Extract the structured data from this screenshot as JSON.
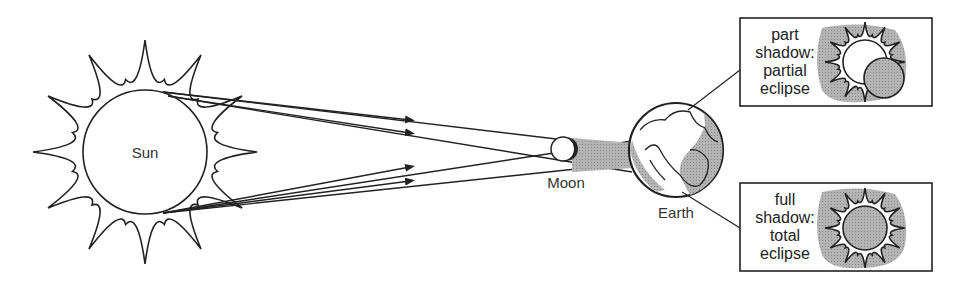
{
  "labels": {
    "sun": "Sun",
    "moon": "Moon",
    "earth": "Earth"
  },
  "boxes": [
    {
      "id": "partial",
      "lines": [
        "part",
        "shadow:",
        "partial",
        "eclipse"
      ]
    },
    {
      "id": "total",
      "lines": [
        "full",
        "shadow:",
        "total",
        "eclipse"
      ]
    }
  ],
  "colors": {
    "line": "#222222",
    "shadow": "#a8a8a8",
    "background": "#ffffff"
  }
}
